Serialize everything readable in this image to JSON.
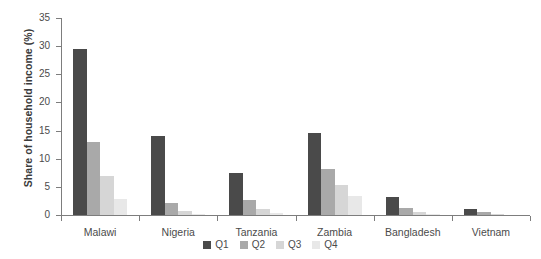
{
  "chart_data": {
    "type": "bar",
    "title": "",
    "xlabel": "",
    "ylabel": "Share of household income (%)",
    "categories": [
      "Malawi",
      "Nigeria",
      "Tanzania",
      "Zambia",
      "Bangladesh",
      "Vietnam"
    ],
    "series": [
      {
        "name": "Q1",
        "color": "#4a4a4a",
        "values": [
          29.5,
          14.0,
          7.5,
          14.5,
          3.2,
          1.1
        ]
      },
      {
        "name": "Q2",
        "color": "#a9a9a9",
        "values": [
          13.0,
          2.2,
          2.7,
          8.1,
          1.3,
          0.5
        ]
      },
      {
        "name": "Q3",
        "color": "#d6d6d6",
        "values": [
          6.9,
          0.8,
          1.1,
          5.4,
          0.5,
          0.1
        ]
      },
      {
        "name": "Q4",
        "color": "#e8e8e8",
        "values": [
          2.8,
          0.2,
          0.3,
          3.4,
          0.1,
          0.0
        ]
      }
    ],
    "ylim": [
      0,
      35
    ],
    "yticks": [
      0,
      5,
      10,
      15,
      20,
      25,
      30,
      35
    ],
    "ytick_labels": [
      "0",
      "5",
      "10",
      "15",
      "20",
      "25",
      "30",
      "35"
    ],
    "grid": false,
    "legend_position": "bottom",
    "legend_entries": [
      "Q1",
      "Q2",
      "Q3",
      "Q4"
    ],
    "axis_color": "#7d7d7d",
    "background": "#ffffff"
  },
  "title_remnant": "",
  "accent_color": "#4a4a4a"
}
